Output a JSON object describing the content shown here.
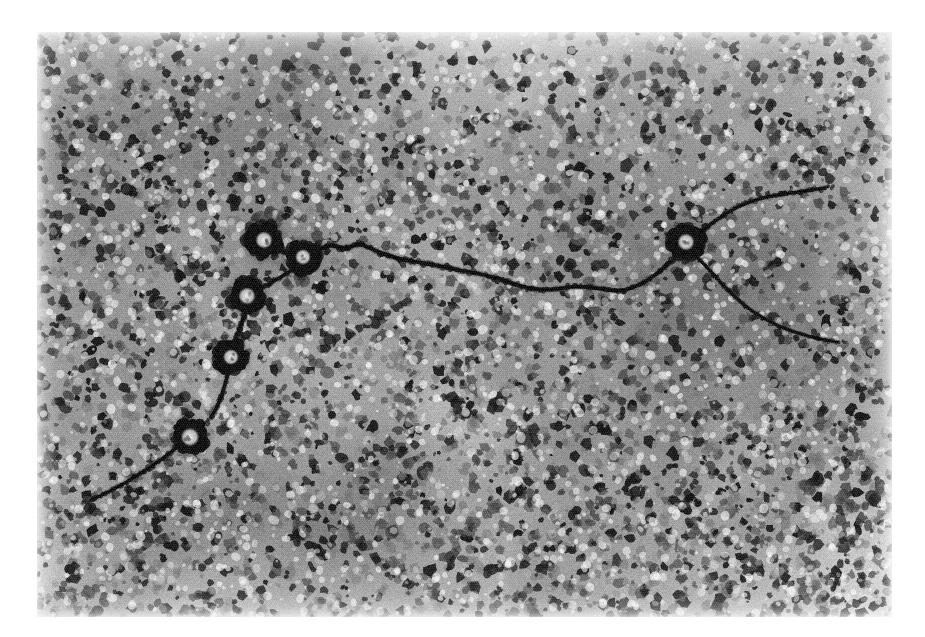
{
  "figure": {
    "kind": "electron-micrograph",
    "modality": "transmission electron microscopy, negative stain",
    "caption": "",
    "scale_bar_label": "",
    "frame": {
      "left": 37,
      "top": 32,
      "width": 855,
      "height": 585,
      "background_hex": "#ffffff"
    },
    "tones": {
      "paper_hex": "#ffffff",
      "field_light_hex": "#d8d8d8",
      "field_mid_hex": "#9a9a9a",
      "grain_dark_hex": "#2a2a2a",
      "particle_dark_hex": "#171717",
      "filament_hex": "#202020"
    },
    "grain": {
      "description": "dense negative-stain granularity",
      "blob_count": 5200,
      "blob_radius_min": 1.6,
      "blob_radius_max": 6.2,
      "halftone_pitch": 2,
      "noise_opacity": 0.34
    },
    "rings": [
      {
        "id": "ring-1",
        "cx": 264,
        "cy": 240,
        "r_outer": 17,
        "r_inner": 6.5,
        "rot": -12
      },
      {
        "id": "ring-2",
        "cx": 303,
        "cy": 257,
        "r_outer": 16,
        "r_inner": 6.0,
        "rot": 20
      },
      {
        "id": "ring-3",
        "cx": 247,
        "cy": 296,
        "r_outer": 17,
        "r_inner": 6.5,
        "rot": 6
      },
      {
        "id": "ring-4",
        "cx": 231,
        "cy": 357,
        "r_outer": 16,
        "r_inner": 6.0,
        "rot": -25
      },
      {
        "id": "ring-5",
        "cx": 190,
        "cy": 437,
        "r_outer": 17,
        "r_inner": 7.0,
        "rot": 14
      },
      {
        "id": "ring-6",
        "cx": 686,
        "cy": 242,
        "r_outer": 17,
        "r_inner": 6.5,
        "rot": -8
      }
    ],
    "filaments": [
      {
        "id": "filament-main",
        "points": [
          [
            313,
            253
          ],
          [
            330,
            244
          ],
          [
            344,
            249
          ],
          [
            360,
            243
          ],
          [
            378,
            252
          ],
          [
            398,
            259
          ],
          [
            418,
            262
          ],
          [
            440,
            266
          ],
          [
            462,
            271
          ],
          [
            486,
            275
          ],
          [
            508,
            282
          ],
          [
            530,
            289
          ],
          [
            552,
            290
          ],
          [
            574,
            286
          ],
          [
            598,
            288
          ],
          [
            622,
            292
          ],
          [
            646,
            282
          ],
          [
            664,
            268
          ],
          [
            676,
            256
          ]
        ],
        "width": 4.0
      },
      {
        "id": "filament-right",
        "points": [
          [
            696,
            236
          ],
          [
            712,
            223
          ],
          [
            728,
            212
          ],
          [
            746,
            203
          ],
          [
            766,
            197
          ],
          [
            790,
            193
          ],
          [
            812,
            190
          ],
          [
            836,
            186
          ]
        ],
        "width": 3.4
      },
      {
        "id": "filament-right-lower",
        "points": [
          [
            694,
            254
          ],
          [
            708,
            268
          ],
          [
            722,
            284
          ],
          [
            738,
            300
          ],
          [
            756,
            314
          ],
          [
            778,
            326
          ],
          [
            800,
            334
          ],
          [
            824,
            340
          ],
          [
            850,
            344
          ]
        ],
        "width": 3.2
      },
      {
        "id": "filament-ring1-ring2",
        "points": [
          [
            278,
            250
          ],
          [
            288,
            254
          ],
          [
            296,
            255
          ]
        ],
        "width": 3.6
      },
      {
        "id": "filament-ring2-ring3",
        "points": [
          [
            292,
            270
          ],
          [
            276,
            280
          ],
          [
            262,
            288
          ]
        ],
        "width": 3.4
      },
      {
        "id": "filament-ring3-ring4",
        "points": [
          [
            245,
            313
          ],
          [
            240,
            328
          ],
          [
            235,
            342
          ]
        ],
        "width": 3.8
      },
      {
        "id": "filament-ring4-ring5",
        "points": [
          [
            228,
            373
          ],
          [
            223,
            392
          ],
          [
            216,
            410
          ],
          [
            206,
            424
          ]
        ],
        "width": 3.6
      },
      {
        "id": "filament-ring5-tail",
        "points": [
          [
            176,
            448
          ],
          [
            158,
            462
          ],
          [
            140,
            474
          ],
          [
            120,
            486
          ],
          [
            100,
            496
          ],
          [
            82,
            504
          ]
        ],
        "width": 3.4
      }
    ]
  }
}
